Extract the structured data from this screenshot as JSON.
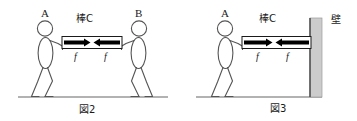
{
  "figure": {
    "title_fig2": "図2",
    "title_fig3": "図3",
    "rod_label_fig2": "棒C",
    "rod_label_fig3": "棒C",
    "person_a_fig2": "A",
    "person_b_fig2": "B",
    "person_a_fig3": "A",
    "wall_label": "壁",
    "force_fig2_left": "f",
    "force_fig2_right": "f",
    "force_fig3_left": "f",
    "force_fig3_right": "f"
  },
  "colors": {
    "ink": "#1a1a1a",
    "stroke": "#555555",
    "arrow_fill": "#000000",
    "rod_fill": "#ffffff",
    "wall_fill": "#cccccc",
    "wall_edge": "#555555",
    "ground": "#666666",
    "background": "#ffffff"
  },
  "scene": {
    "ground_y": 97,
    "fig2_center_x": 88,
    "fig3_center_x": 268
  }
}
